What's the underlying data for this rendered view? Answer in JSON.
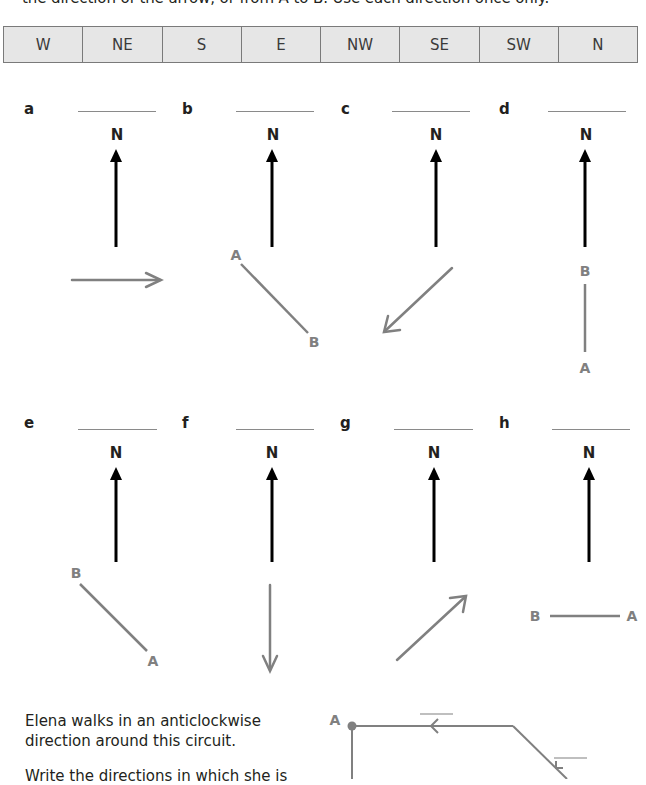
{
  "instructions": {
    "text": "the direction of the arrow, or from A to B. Use each direction once only."
  },
  "directions_table": {
    "cells": [
      "W",
      "NE",
      "S",
      "E",
      "NW",
      "SE",
      "SW",
      "N"
    ]
  },
  "panels": [
    {
      "label": "a",
      "north": "N",
      "answer": "",
      "type": "arrow",
      "direction_shown": "east"
    },
    {
      "label": "b",
      "north": "N",
      "answer": "",
      "type": "segment",
      "from": "A",
      "to": "B"
    },
    {
      "label": "c",
      "north": "N",
      "answer": "",
      "type": "arrow",
      "direction_shown": "south-west"
    },
    {
      "label": "d",
      "north": "N",
      "answer": "",
      "type": "segment",
      "from": "A",
      "to": "B"
    },
    {
      "label": "e",
      "north": "N",
      "answer": "",
      "type": "segment",
      "from": "A",
      "to": "B"
    },
    {
      "label": "f",
      "north": "N",
      "answer": "",
      "type": "arrow",
      "direction_shown": "south"
    },
    {
      "label": "g",
      "north": "N",
      "answer": "",
      "type": "arrow",
      "direction_shown": "north-east"
    },
    {
      "label": "h",
      "north": "N",
      "answer": "",
      "type": "segment",
      "from": "A",
      "to": "B"
    }
  ],
  "points": {
    "A": "A",
    "B": "B"
  },
  "circuit_question": {
    "line1": "Elena walks in an anticlockwise",
    "line2": "direction around this circuit.",
    "line3": "Write the directions in which she is",
    "start_point": "A"
  },
  "colors": {
    "north_arrow": "#000000",
    "grey_arrow": "#808080",
    "table_fill": "#e6e6e6",
    "table_border": "#7a7a7a"
  }
}
